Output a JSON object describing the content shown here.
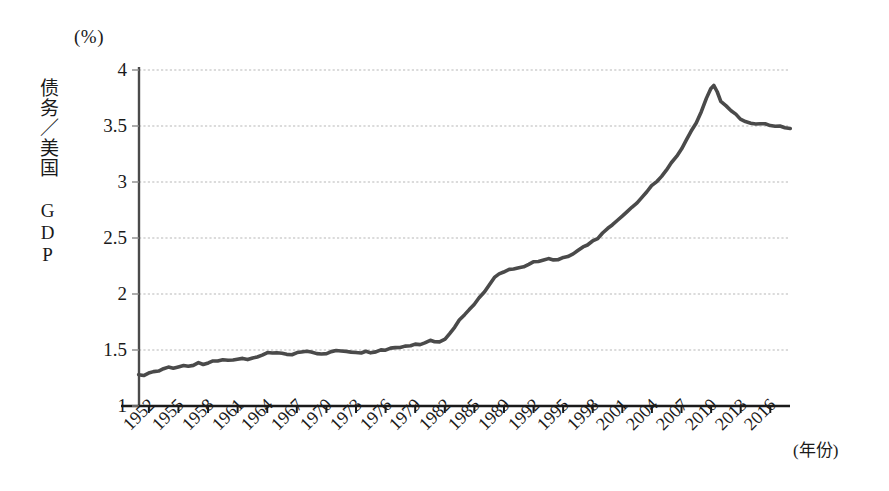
{
  "chart_data": {
    "type": "line",
    "title": "",
    "subtitle": "",
    "unit_label": "(%)",
    "ylabel": "债务／美国 GDP",
    "xlabel": "(年份)",
    "ylim": [
      1,
      4
    ],
    "yticks": [
      "1",
      "1.5",
      "2",
      "2.5",
      "3",
      "3.5",
      "4"
    ],
    "ytick_values": [
      1,
      1.5,
      2,
      2.5,
      3,
      3.5,
      4
    ],
    "xlim": [
      1951,
      2017
    ],
    "xticks": [
      "1952",
      "1955",
      "1958",
      "1961",
      "1964",
      "1967",
      "1970",
      "1973",
      "1976",
      "1979",
      "1982",
      "1985",
      "1989",
      "1992",
      "1995",
      "1998",
      "2001",
      "2004",
      "2007",
      "2010",
      "2013",
      "2016"
    ],
    "xtick_values": [
      1952,
      1955,
      1958,
      1961,
      1964,
      1967,
      1970,
      1973,
      1976,
      1979,
      1982,
      1985,
      1988,
      1991,
      1994,
      1997,
      2000,
      2003,
      2006,
      2009,
      2012,
      2015
    ],
    "grid": true,
    "grid_axis": "y",
    "legend": false,
    "line_color": "#4a4a4a",
    "axis_color": "#1a1a1a",
    "grid_color": "#b8b8b8",
    "series": [
      {
        "name": "债务／美国 GDP",
        "x": [
          1951.0,
          1951.5,
          1952.0,
          1952.5,
          1953.0,
          1953.5,
          1954.0,
          1954.5,
          1955.0,
          1955.5,
          1956.0,
          1956.5,
          1957.0,
          1957.5,
          1958.0,
          1958.5,
          1959.0,
          1959.5,
          1960.0,
          1960.5,
          1961.0,
          1961.5,
          1962.0,
          1962.5,
          1963.0,
          1963.5,
          1964.0,
          1964.5,
          1965.0,
          1965.5,
          1966.0,
          1966.5,
          1967.0,
          1967.5,
          1968.0,
          1968.5,
          1969.0,
          1969.5,
          1970.0,
          1970.5,
          1971.0,
          1971.5,
          1972.0,
          1972.5,
          1973.0,
          1973.5,
          1974.0,
          1974.5,
          1975.0,
          1975.5,
          1976.0,
          1976.5,
          1977.0,
          1977.5,
          1978.0,
          1978.5,
          1979.0,
          1979.5,
          1980.0,
          1980.5,
          1981.0,
          1981.5,
          1982.0,
          1982.5,
          1983.0,
          1983.5,
          1984.0,
          1984.5,
          1985.0,
          1985.5,
          1986.0,
          1986.5,
          1987.0,
          1987.5,
          1988.0,
          1988.5,
          1989.0,
          1989.5,
          1990.0,
          1990.5,
          1991.0,
          1991.5,
          1992.0,
          1992.5,
          1993.0,
          1993.5,
          1994.0,
          1994.5,
          1995.0,
          1995.5,
          1996.0,
          1996.5,
          1997.0,
          1997.5,
          1998.0,
          1998.5,
          1999.0,
          1999.5,
          2000.0,
          2000.5,
          2001.0,
          2001.5,
          2002.0,
          2002.5,
          2003.0,
          2003.5,
          2004.0,
          2004.5,
          2005.0,
          2005.5,
          2006.0,
          2006.5,
          2007.0,
          2007.5,
          2008.0,
          2008.5,
          2009.0,
          2009.3,
          2009.6,
          2010.0,
          2010.5,
          2011.0,
          2011.5,
          2012.0,
          2012.5,
          2013.0,
          2013.5,
          2014.0,
          2014.5,
          2015.0,
          2015.5,
          2016.0,
          2016.5,
          2017.0
        ],
        "y": [
          1.285,
          1.275,
          1.29,
          1.3,
          1.31,
          1.33,
          1.345,
          1.335,
          1.35,
          1.36,
          1.355,
          1.37,
          1.38,
          1.375,
          1.385,
          1.4,
          1.395,
          1.405,
          1.4,
          1.41,
          1.42,
          1.425,
          1.415,
          1.43,
          1.44,
          1.455,
          1.47,
          1.48,
          1.475,
          1.47,
          1.465,
          1.46,
          1.47,
          1.485,
          1.49,
          1.48,
          1.47,
          1.465,
          1.47,
          1.48,
          1.49,
          1.495,
          1.49,
          1.485,
          1.48,
          1.475,
          1.485,
          1.48,
          1.49,
          1.5,
          1.505,
          1.51,
          1.515,
          1.52,
          1.53,
          1.54,
          1.545,
          1.55,
          1.57,
          1.59,
          1.58,
          1.57,
          1.6,
          1.65,
          1.7,
          1.76,
          1.82,
          1.86,
          1.9,
          1.96,
          2.02,
          2.08,
          2.14,
          2.18,
          2.2,
          2.215,
          2.225,
          2.23,
          2.25,
          2.265,
          2.28,
          2.29,
          2.3,
          2.31,
          2.3,
          2.305,
          2.32,
          2.34,
          2.36,
          2.39,
          2.42,
          2.44,
          2.47,
          2.5,
          2.54,
          2.58,
          2.62,
          2.66,
          2.7,
          2.74,
          2.78,
          2.82,
          2.87,
          2.91,
          2.96,
          3.0,
          3.05,
          3.11,
          3.17,
          3.23,
          3.3,
          3.38,
          3.45,
          3.53,
          3.63,
          3.74,
          3.84,
          3.855,
          3.8,
          3.72,
          3.68,
          3.64,
          3.6,
          3.565,
          3.545,
          3.53,
          3.52,
          3.525,
          3.515,
          3.505,
          3.5,
          3.495,
          3.49,
          3.485
        ]
      }
    ]
  }
}
